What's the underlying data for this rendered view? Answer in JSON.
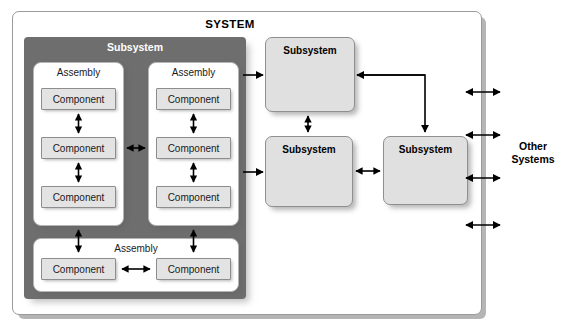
{
  "diagram": {
    "title": "SYSTEM",
    "type": "system-hierarchy-block-diagram",
    "outer_boundary_label": "SYSTEM",
    "external_label_line1": "Other",
    "external_label_line2": "Systems",
    "colors": {
      "subsystem_container_fill": "#6e6e6e",
      "subsystem_container_text": "#ffffff",
      "assembly_fill": "#ffffff",
      "component_fill": "#e3e3e3",
      "subsystem_light_fill": "#e0e0e0",
      "system_border": "#9a9a9a",
      "arrow": "#000000",
      "page_background": "#ffffff"
    }
  },
  "subsystem_container": {
    "label": "Subsystem",
    "assemblies": [
      {
        "label": "Assembly",
        "components": [
          {
            "label": "Component"
          },
          {
            "label": "Component"
          },
          {
            "label": "Component"
          }
        ]
      },
      {
        "label": "Assembly",
        "components": [
          {
            "label": "Component"
          },
          {
            "label": "Component"
          },
          {
            "label": "Component"
          }
        ]
      },
      {
        "label": "Assembly",
        "components": [
          {
            "label": "Component"
          },
          {
            "label": "Component"
          }
        ]
      }
    ]
  },
  "subsystems": [
    {
      "id": "top-right",
      "label": "Subsystem"
    },
    {
      "id": "middle-left",
      "label": "Subsystem"
    },
    {
      "id": "middle-right",
      "label": "Subsystem"
    }
  ],
  "external_interfaces": {
    "label": "Other Systems",
    "arrow_count": 4
  }
}
